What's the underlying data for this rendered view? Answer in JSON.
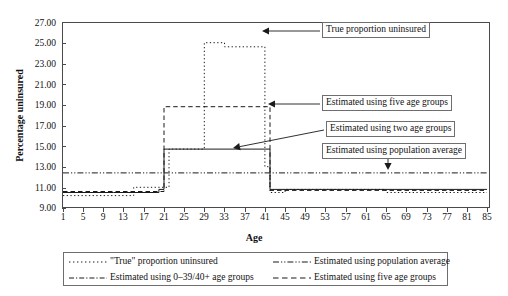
{
  "chart_data": {
    "type": "line",
    "title": "",
    "xlabel": "Age",
    "ylabel": "Percentage uninsured",
    "xlim": [
      1,
      85
    ],
    "ylim": [
      9.0,
      27.0
    ],
    "yticks": [
      "9.00",
      "11.00",
      "13.00",
      "15.00",
      "17.00",
      "19.00",
      "21.00",
      "23.00",
      "25.00",
      "27.00"
    ],
    "xticks": [
      "1",
      "5",
      "9",
      "13",
      "17",
      "21",
      "25",
      "29",
      "33",
      "37",
      "41",
      "45",
      "49",
      "53",
      "57",
      "61",
      "65",
      "69",
      "73",
      "77",
      "81",
      "85"
    ],
    "grid": false,
    "legend_position": "bottom",
    "series": [
      {
        "name": "\"True\" proportion uninsured",
        "style": "dotted",
        "x": [
          1,
          9,
          15,
          21,
          22,
          25,
          29,
          32,
          33,
          40,
          41,
          42,
          45,
          53,
          65,
          85
        ],
        "values": [
          10.2,
          10.2,
          11.0,
          11.0,
          14.7,
          14.7,
          25.0,
          25.0,
          24.6,
          24.6,
          13.0,
          10.5,
          10.8,
          10.8,
          10.5,
          10.5
        ]
      },
      {
        "name": "Estimated using population average",
        "style": "dash-dot",
        "x": [
          1,
          85
        ],
        "values": [
          12.4,
          12.4
        ]
      },
      {
        "name": "Estimated using 0–39/40+ age groups",
        "style": "solid",
        "x": [
          1,
          11,
          20,
          21,
          41,
          42,
          85
        ],
        "values": [
          10.5,
          10.5,
          10.8,
          14.7,
          14.7,
          10.8,
          10.8
        ]
      },
      {
        "name": "Estimated using five age groups",
        "style": "dashed",
        "x": [
          1,
          20,
          21,
          41,
          42,
          85
        ],
        "values": [
          10.6,
          10.6,
          18.8,
          18.8,
          10.7,
          10.7
        ]
      }
    ],
    "annotations": [
      {
        "text": "True proportion uninsured",
        "points_to": "true-proportion-peak"
      },
      {
        "text": "Estimated using five age groups",
        "points_to": "five-age-groups-plateau"
      },
      {
        "text": "Estimated using two age groups",
        "points_to": "two-age-groups-level"
      },
      {
        "text": "Estimated using population average",
        "points_to": "population-average-line"
      }
    ]
  },
  "axes": {
    "ylabel": "Percentage uninsured",
    "xlabel": "Age",
    "yticks": [
      "27.00",
      "25.00",
      "23.00",
      "21.00",
      "19.00",
      "17.00",
      "15.00",
      "13.00",
      "11.00",
      "9.00"
    ],
    "xticks": [
      "1",
      "5",
      "9",
      "13",
      "17",
      "21",
      "25",
      "29",
      "33",
      "37",
      "41",
      "45",
      "49",
      "53",
      "57",
      "61",
      "65",
      "69",
      "73",
      "77",
      "81",
      "85"
    ]
  },
  "callouts": {
    "true_proportion": "True proportion uninsured",
    "five_age_groups": "Estimated using five age groups",
    "two_age_groups": "Estimated using two age groups",
    "population_average": "Estimated using population average"
  },
  "legend": {
    "items": [
      {
        "label": "\"True\" proportion uninsured",
        "style": "dotted"
      },
      {
        "label": "Estimated using population average",
        "style": "dash-dot"
      },
      {
        "label": "Estimated using 0–39/40+ age groups",
        "style": "dash-dot-dot"
      },
      {
        "label": "Estimated using five age groups",
        "style": "dashed"
      }
    ]
  },
  "colors": {
    "line": "#1a1a1a",
    "axis": "#4a4a4a",
    "box_border": "#6e6e6e",
    "background": "#ffffff"
  }
}
